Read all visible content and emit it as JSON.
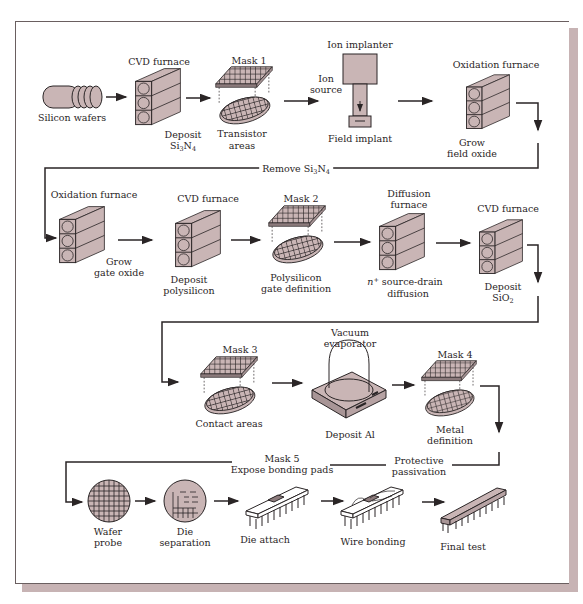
{
  "figure": {
    "colors": {
      "fill": "#c9b5b5",
      "stroke": "#2a2526",
      "frame_shadow": "#c7b3b4"
    }
  },
  "rows": [
    {
      "steps": [
        {
          "id": "silicon-wafers",
          "equipment": "",
          "label": "Silicon wafers",
          "icon": "wafer-stack-icon"
        },
        {
          "id": "deposit-si3n4",
          "equipment": "CVD furnace",
          "label_lines": [
            "Deposit",
            "Si3N4"
          ],
          "icon": "furnace-icon"
        },
        {
          "id": "transistor-areas",
          "equipment": "Mask 1",
          "label_lines": [
            "Transistor",
            "areas"
          ],
          "icon": "mask-wafer-icon"
        },
        {
          "id": "ion-source",
          "equipment": "",
          "label_lines": [
            "Ion",
            "source"
          ],
          "icon": ""
        },
        {
          "id": "field-implant",
          "equipment": "Ion implanter",
          "label": "Field implant",
          "icon": "ion-implanter-icon"
        },
        {
          "id": "grow-field-oxide",
          "equipment": "Oxidation furnace",
          "label_lines": [
            "Grow",
            "field oxide"
          ],
          "icon": "furnace-icon"
        }
      ],
      "connector_label": "Remove Si3N4"
    },
    {
      "steps": [
        {
          "id": "grow-gate-oxide",
          "equipment": "Oxidation furnace",
          "label_lines": [
            "Grow",
            "gate oxide"
          ],
          "icon": "furnace-icon"
        },
        {
          "id": "deposit-polysilicon",
          "equipment": "CVD furnace",
          "label_lines": [
            "Deposit",
            "polysilicon"
          ],
          "icon": "furnace-icon"
        },
        {
          "id": "polysilicon-gate-definition",
          "equipment": "Mask 2",
          "label_lines": [
            "Polysilicon",
            "gate definition"
          ],
          "icon": "mask-wafer-icon"
        },
        {
          "id": "source-drain-diffusion",
          "equipment_lines": [
            "Diffusion",
            "furnace"
          ],
          "label_lines": [
            "n+ source-drain",
            "diffusion"
          ],
          "icon": "furnace-icon"
        },
        {
          "id": "deposit-sio2",
          "equipment": "CVD furnace",
          "label_lines": [
            "Deposit",
            "SiO2"
          ],
          "icon": "furnace-icon"
        }
      ],
      "connector_label": ""
    },
    {
      "steps": [
        {
          "id": "contact-areas",
          "equipment": "Mask 3",
          "label": "Contact areas",
          "icon": "mask-wafer-icon"
        },
        {
          "id": "deposit-al",
          "equipment_lines": [
            "Vacuum",
            "evaporator"
          ],
          "label": "Deposit Al",
          "icon": "vacuum-evaporator-icon"
        },
        {
          "id": "metal-definition",
          "equipment": "Mask 4",
          "label_lines": [
            "Metal",
            "definition"
          ],
          "icon": "mask-wafer-icon"
        }
      ],
      "connector_label_lines": [
        "Protective",
        "passivation"
      ],
      "connector_label2_lines": [
        "Mask 5",
        "Expose bonding pads"
      ]
    },
    {
      "steps": [
        {
          "id": "wafer-probe",
          "label_lines": [
            "Wafer",
            "probe"
          ],
          "icon": "probed-wafer-icon"
        },
        {
          "id": "die-separation",
          "label_lines": [
            "Die",
            "separation"
          ],
          "icon": "separated-wafer-icon"
        },
        {
          "id": "die-attach",
          "label": "Die attach",
          "icon": "chip-package-icon"
        },
        {
          "id": "wire-bonding",
          "label": "Wire bonding",
          "icon": "chip-package-icon"
        },
        {
          "id": "final-test",
          "label": "Final test",
          "icon": "sealed-chip-icon"
        }
      ]
    }
  ],
  "text": {
    "cvd1": "CVD furnace",
    "mask1": "Mask 1",
    "ion_implanter": "Ion implanter",
    "oxfurn1": "Oxidation furnace",
    "silicon_wafers": "Silicon wafers",
    "deposit": "Deposit",
    "si3n4_main": "Si",
    "si3n4_sub1": "3",
    "n": "N",
    "si3n4_sub2": "4",
    "transistor": "Transistor",
    "areas": "areas",
    "ion": "Ion",
    "source": "source",
    "field_implant": "Field implant",
    "grow": "Grow",
    "field_oxide": "field oxide",
    "remove": "Remove Si",
    "oxfurn2": "Oxidation furnace",
    "gate_oxide": "gate oxide",
    "cvd2": "CVD furnace",
    "polysilicon": "polysilicon",
    "mask2": "Mask 2",
    "polysilicon_cap": "Polysilicon",
    "gate_definition": "gate definition",
    "diffusion": "Diffusion",
    "furnace": "furnace",
    "n_plus": "n",
    "plus": "+",
    "source_drain": " source-drain",
    "diffusion_l": "diffusion",
    "cvd3": "CVD furnace",
    "sio2": "SiO",
    "two": "2",
    "mask3": "Mask 3",
    "contact_areas": "Contact areas",
    "vacuum": "Vacuum",
    "evaporator": "evaporator",
    "deposit_al": "Deposit Al",
    "mask4": "Mask 4",
    "metal": "Metal",
    "definition": "definition",
    "protective": "Protective",
    "passivation": "passivation",
    "mask5": "Mask 5",
    "expose": "Expose bonding pads",
    "wafer": "Wafer",
    "probe": "probe",
    "die": "Die",
    "separation": "separation",
    "die_attach": "Die attach",
    "wire_bonding": "Wire bonding",
    "final_test": "Final test"
  }
}
